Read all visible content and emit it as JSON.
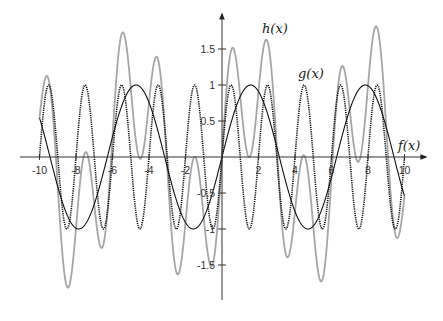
{
  "chart_data": {
    "type": "line",
    "title": "",
    "xlabel": "",
    "ylabel": "",
    "xlim": [
      -10,
      10
    ],
    "ylim": [
      -1.5,
      1.5
    ],
    "grid": false,
    "x_ticks": [
      -10,
      -8,
      -6,
      -4,
      -2,
      2,
      4,
      6,
      8,
      10
    ],
    "x_tick_labels": [
      "-10",
      "-8",
      "-6",
      "-4",
      "-2",
      "2",
      "4",
      "6",
      "8",
      "10"
    ],
    "y_ticks": [
      1.5,
      1,
      0.5,
      -0.5,
      -1,
      -1.5
    ],
    "y_tick_labels": [
      "1.5",
      "1",
      "0.5",
      "-0.5",
      "-1",
      "-1.5"
    ],
    "series": [
      {
        "name": "f(x)",
        "label": "f(x)",
        "formula": "sin(pi*x)",
        "style": "dotted",
        "color": "#111111",
        "x": [
          -10,
          -9.5,
          -9,
          -8.5,
          -8,
          -7.5,
          -7,
          -6.5,
          -6,
          -5.5,
          -5,
          -4.5,
          -4,
          -3.5,
          -3,
          -2.5,
          -2,
          -1.5,
          -1,
          -0.5,
          0,
          0.5,
          1,
          1.5,
          2,
          2.5,
          3,
          3.5,
          4,
          4.5,
          5,
          5.5,
          6,
          6.5,
          7,
          7.5,
          8,
          8.5,
          9,
          9.5,
          10
        ],
        "values": [
          0,
          1,
          0,
          -1,
          0,
          1,
          0,
          -1,
          0,
          1,
          0,
          -1,
          0,
          1,
          0,
          -1,
          0,
          1,
          0,
          -1,
          0,
          1,
          0,
          -1,
          0,
          1,
          0,
          -1,
          0,
          1,
          0,
          -1,
          0,
          1,
          0,
          -1,
          0,
          1,
          0,
          -1,
          0
        ]
      },
      {
        "name": "g(x)",
        "label": "g(x)",
        "formula": "sin(x)",
        "style": "solid",
        "color": "#111111",
        "x": [
          -10,
          -9.5,
          -9,
          -8.5,
          -8,
          -7.5,
          -7,
          -6.5,
          -6,
          -5.5,
          -5,
          -4.5,
          -4,
          -3.5,
          -3,
          -2.5,
          -2,
          -1.5,
          -1,
          -0.5,
          0,
          0.5,
          1,
          1.5,
          2,
          2.5,
          3,
          3.5,
          4,
          4.5,
          5,
          5.5,
          6,
          6.5,
          7,
          7.5,
          8,
          8.5,
          9,
          9.5,
          10
        ],
        "values": [
          0.54,
          -0.08,
          -0.41,
          -0.8,
          -0.99,
          -0.94,
          -0.66,
          -0.22,
          0.28,
          0.71,
          0.96,
          0.98,
          0.76,
          0.35,
          -0.14,
          -0.6,
          -0.91,
          -1.0,
          -0.84,
          -0.48,
          0,
          0.48,
          0.84,
          1.0,
          0.91,
          0.6,
          0.14,
          -0.35,
          -0.76,
          -0.98,
          -0.96,
          -0.71,
          -0.28,
          0.22,
          0.66,
          0.94,
          0.99,
          0.8,
          0.41,
          0.08,
          -0.54
        ]
      },
      {
        "name": "h(x)",
        "label": "h(x)",
        "formula": "sin(pi*x) + sin(x)",
        "style": "solid",
        "color": "#a6a6a6",
        "x": [
          -10,
          -9.5,
          -9,
          -8.5,
          -8,
          -7.5,
          -7,
          -6.5,
          -6,
          -5.5,
          -5,
          -4.5,
          -4,
          -3.5,
          -3,
          -2.5,
          -2,
          -1.5,
          -1,
          -0.5,
          0,
          0.5,
          1,
          1.5,
          2,
          2.5,
          3,
          3.5,
          4,
          4.5,
          5,
          5.5,
          6,
          6.5,
          7,
          7.5,
          8,
          8.5,
          9,
          9.5,
          10
        ],
        "values": [
          0.54,
          0.92,
          -0.41,
          -1.8,
          -0.99,
          0.06,
          -0.66,
          -1.22,
          0.28,
          1.71,
          0.96,
          -0.02,
          0.76,
          1.35,
          -0.14,
          -1.6,
          -0.91,
          0.0,
          -0.84,
          -1.48,
          0,
          1.48,
          0.84,
          0.0,
          0.91,
          1.6,
          0.14,
          -1.35,
          -0.76,
          0.02,
          -0.96,
          -1.71,
          -0.28,
          1.22,
          0.66,
          -0.06,
          0.99,
          1.8,
          0.41,
          -0.92,
          -0.54
        ]
      }
    ],
    "legend": "inline labels",
    "annotations": [
      {
        "text": "h(x)",
        "near": [
          1.6,
          1.75
        ]
      },
      {
        "text": "g(x)",
        "near": [
          4.5,
          1.15
        ]
      },
      {
        "text": "f(x)",
        "near": [
          9.8,
          0.2
        ]
      }
    ],
    "layout": {
      "origin_px": [
        222,
        157
      ],
      "x_unit_px": 18.25,
      "y_unit_px": 72,
      "x_axis_px": [
        20,
        426
      ],
      "y_axis_px": [
        14,
        300
      ]
    }
  }
}
